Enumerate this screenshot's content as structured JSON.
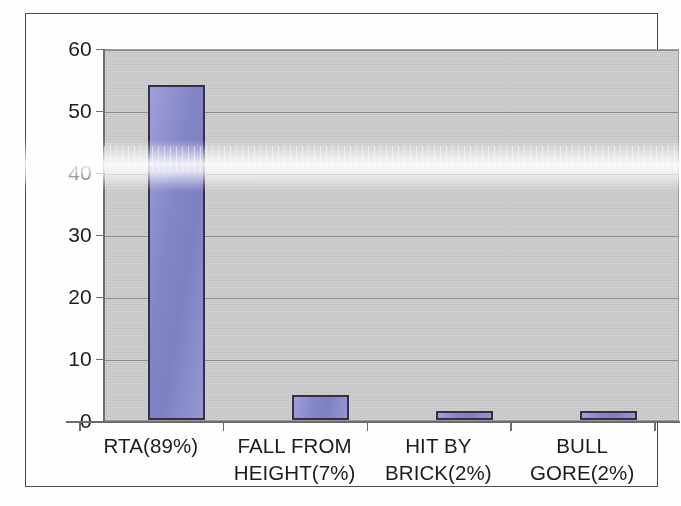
{
  "chart_data": {
    "type": "bar",
    "title": "",
    "subtitle": "",
    "xlabel": "",
    "ylabel": "",
    "categories": [
      "RTA(89%)",
      "FALL FROM HEIGHT(7%)",
      "HIT BY BRICK(2%)",
      "BULL GORE(2%)"
    ],
    "category_lines": [
      [
        "RTA(89%)"
      ],
      [
        "FALL FROM",
        "HEIGHT(7%)"
      ],
      [
        "HIT BY",
        "BRICK(2%)"
      ],
      [
        "BULL",
        "GORE(2%)"
      ]
    ],
    "values": [
      54,
      4,
      1,
      1
    ],
    "ylim": [
      0,
      60
    ],
    "ytick_labels": [
      "60",
      "50",
      "40",
      "30",
      "20",
      "10",
      "0"
    ],
    "ytick_values": [
      60,
      50,
      40,
      30,
      20,
      10,
      0
    ],
    "grid": true,
    "grid_axis": "y",
    "legend": false,
    "legend_position": "none",
    "series": [
      {
        "name": "Cause of injury",
        "values": [
          54,
          4,
          1,
          1
        ]
      }
    ]
  },
  "style": {
    "bar_fill": "#8486c8",
    "bar_fill_light": "#9fa0da",
    "bar_border": "#34304a",
    "plot_background": "#d2d2d2",
    "gridline_color": "#8d8d8d",
    "axis_color": "#6d6d6d",
    "frame_color": "#4a4a4a",
    "text_color": "#1c1c1c",
    "page_background": "#ffffff"
  },
  "artifacts": {
    "glare_band_label": "scanner-glare-band"
  }
}
